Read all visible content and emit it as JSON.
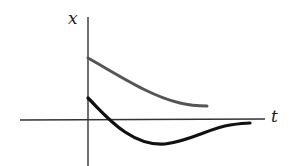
{
  "diagram": {
    "axes": {
      "y_label": "x",
      "x_label": "t",
      "color": "#333333"
    },
    "curves": [
      {
        "name": "overdamped-decay",
        "color": "#555555",
        "description": "Gray curve starting at positive x, decaying monotonically toward zero"
      },
      {
        "name": "critically-damped-overshoot",
        "color": "#111111",
        "description": "Black curve starting at positive x, crossing zero once, undershooting to a minimum, then approaching zero"
      }
    ]
  }
}
